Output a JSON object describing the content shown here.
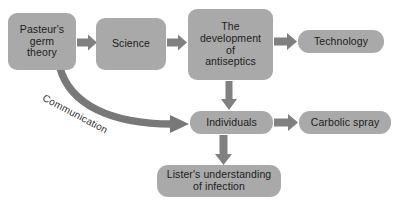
{
  "diagram": {
    "colors": {
      "node_fill": "#a9a9a9",
      "arrow_fill": "#808080",
      "text": "#1c1c1c",
      "background": "#ffffff"
    },
    "nodes": [
      {
        "id": "pasteur",
        "lines": [
          "Pasteur's",
          "germ",
          "theory"
        ]
      },
      {
        "id": "science",
        "lines": [
          "Science"
        ]
      },
      {
        "id": "antiseptics",
        "lines": [
          "The",
          "development",
          "of",
          "antiseptics"
        ]
      },
      {
        "id": "technology",
        "lines": [
          "Technology"
        ]
      },
      {
        "id": "individuals",
        "lines": [
          "Individuals"
        ]
      },
      {
        "id": "carbolic",
        "lines": [
          "Carbolic spray"
        ]
      },
      {
        "id": "lister",
        "lines": [
          "Lister's understanding",
          "of infection"
        ]
      }
    ],
    "edges": [
      {
        "id": "pasteur-to-science",
        "label": "",
        "direction": "right"
      },
      {
        "id": "science-to-antiseptics",
        "label": "",
        "direction": "right"
      },
      {
        "id": "antiseptics-to-technology",
        "label": "",
        "direction": "right"
      },
      {
        "id": "antiseptics-to-individuals",
        "label": "",
        "direction": "down"
      },
      {
        "id": "individuals-to-carbolic",
        "label": "",
        "direction": "right"
      },
      {
        "id": "individuals-to-lister",
        "label": "",
        "direction": "down"
      },
      {
        "id": "pasteur-to-individuals",
        "label": "Communication",
        "direction": "curved"
      }
    ]
  }
}
